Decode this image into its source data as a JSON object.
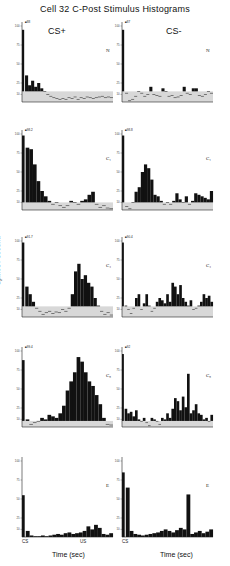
{
  "chart_data": {
    "type": "bar",
    "title": "Cell 32 C-Post Stimulus Histograms",
    "ylabel": "Spikes / second",
    "xlabel": "Time (sec)",
    "columns": [
      "CS+",
      "CS-"
    ],
    "rows": [
      "N",
      "C1",
      "C4",
      "C8",
      "E"
    ],
    "x_markers": [
      "CS",
      "US"
    ],
    "ylim": [
      0,
      100
    ],
    "y_ticks": [
      10,
      25,
      50,
      75,
      100
    ],
    "panels": [
      {
        "row": "N",
        "col": "CS+",
        "peak_label": "88",
        "values": [
          95,
          35,
          22,
          28,
          20,
          25,
          18,
          14,
          10,
          8,
          6,
          5,
          4,
          5,
          4,
          6,
          5,
          7,
          4,
          6,
          5,
          7,
          6,
          5,
          6,
          7,
          8,
          6,
          7,
          6
        ]
      },
      {
        "row": "N",
        "col": "CS-",
        "peak_label": "87",
        "values": [
          95,
          12,
          2,
          4,
          8,
          14,
          12,
          8,
          10,
          20,
          10,
          9,
          8,
          18,
          14,
          8,
          9,
          6,
          7,
          9,
          20,
          12,
          10,
          18,
          18,
          9,
          8,
          10,
          14,
          12
        ]
      },
      {
        "row": "C1",
        "col": "CS+",
        "peak_label": "98.2",
        "values": [
          98,
          82,
          80,
          60,
          38,
          25,
          18,
          12,
          8,
          10,
          6,
          4,
          6,
          12,
          10,
          8,
          12,
          14,
          20,
          24,
          8,
          4,
          6,
          3,
          2
        ]
      },
      {
        "row": "C1",
        "col": "CS-",
        "peak_label": "98.8",
        "values": [
          98,
          5,
          2,
          10,
          24,
          30,
          50,
          60,
          55,
          40,
          20,
          18,
          12,
          8,
          10,
          8,
          12,
          22,
          14,
          10,
          18,
          8,
          12,
          22,
          20,
          18,
          16,
          14,
          25
        ]
      },
      {
        "row": "C4",
        "col": "CS+",
        "peak_label": "91.7",
        "values": [
          98,
          40,
          30,
          20,
          12,
          8,
          4,
          6,
          8,
          5,
          7,
          6,
          10,
          8,
          12,
          30,
          60,
          70,
          50,
          55,
          45,
          40,
          25,
          15,
          8,
          4,
          6,
          3
        ]
      },
      {
        "row": "C4",
        "col": "CS-",
        "peak_label": "90.4",
        "values": [
          98,
          15,
          10,
          5,
          12,
          25,
          30,
          10,
          18,
          30,
          15,
          8,
          12,
          20,
          25,
          22,
          18,
          30,
          20,
          45,
          40,
          30,
          42,
          25,
          20,
          15,
          22,
          10,
          12,
          15,
          20,
          30,
          25,
          28,
          20
        ]
      },
      {
        "row": "C8",
        "col": "CS+",
        "peak_label": "99.4",
        "values": [
          88,
          10,
          4,
          6,
          8,
          12,
          10,
          16,
          14,
          12,
          18,
          28,
          48,
          60,
          72,
          92,
          86,
          72,
          60,
          54,
          42,
          30,
          12,
          4,
          3
        ]
      },
      {
        "row": "C8",
        "col": "CS-",
        "peak_label": "92",
        "values": [
          96,
          24,
          18,
          20,
          14,
          22,
          10,
          8,
          12,
          6,
          2,
          12,
          10,
          8,
          4,
          12,
          10,
          18,
          12,
          24,
          38,
          34,
          22,
          40,
          26,
          70,
          18,
          22,
          30,
          18,
          16,
          10,
          12,
          8,
          16
        ]
      },
      {
        "row": "E",
        "col": "CS+",
        "peak_label": "",
        "values": [
          55,
          8,
          2,
          1,
          1,
          2,
          1,
          2,
          3,
          4,
          3,
          5,
          6,
          4,
          5,
          6,
          8,
          14,
          10,
          16,
          12,
          4,
          3,
          5
        ]
      },
      {
        "row": "E",
        "col": "CS-",
        "peak_label": "",
        "values": [
          85,
          65,
          8,
          4,
          3,
          2,
          3,
          4,
          5,
          6,
          8,
          10,
          8,
          6,
          9,
          12,
          10,
          56,
          4,
          6,
          8,
          5,
          7,
          10
        ]
      }
    ]
  },
  "labels": {
    "title": "Cell 32 C-Post Stimulus Histograms",
    "cs_plus": "CS+",
    "cs_minus": "CS-",
    "ylabel": "Spikes / second",
    "xlabel": "Time (sec)",
    "cs_marker": "CS",
    "us_marker": "US",
    "rows": [
      "N",
      "C₁",
      "C₄",
      "C₈",
      "E"
    ]
  }
}
